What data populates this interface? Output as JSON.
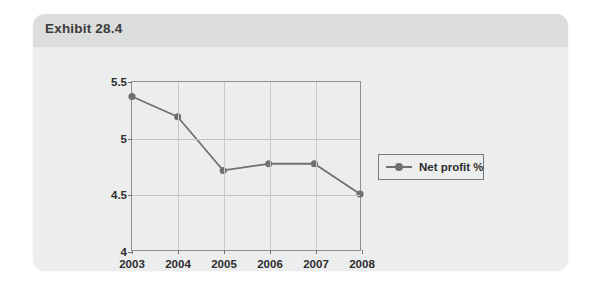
{
  "exhibit": {
    "title": "Exhibit 28.4"
  },
  "colors": {
    "card_background": "#eceded",
    "card_header": "#dcdddd",
    "series_line": "#6e7071",
    "axis": "#8d8f90",
    "gridline": "#c2c4c4",
    "text": "#2e2e2e"
  },
  "legend": {
    "position": "right",
    "entries": [
      {
        "label": "Net profit %",
        "marker": "line-with-dot",
        "color": "#6e7071"
      }
    ]
  },
  "chart_data": {
    "type": "line",
    "title": "",
    "subtitle": "",
    "xlabel": "",
    "ylabel": "",
    "categories": [
      "2003",
      "2004",
      "2005",
      "2006",
      "2007",
      "2008"
    ],
    "x": [
      2003,
      2004,
      2005,
      2006,
      2007,
      2008
    ],
    "series": [
      {
        "name": "Net profit %",
        "color": "#6e7071",
        "values": [
          5.37,
          5.19,
          4.71,
          4.77,
          4.77,
          4.5
        ]
      }
    ],
    "ylim": [
      4,
      5.5
    ],
    "yticks": [
      4,
      4.5,
      5,
      5.5
    ],
    "ytick_labels": [
      "4",
      "4.5",
      "5",
      "5.5"
    ],
    "xtick_labels": [
      "2003",
      "2004",
      "2005",
      "2006",
      "2007",
      "2008"
    ],
    "grid": true,
    "grid_axis": "both",
    "legend_position": "right",
    "marker": "circle"
  }
}
